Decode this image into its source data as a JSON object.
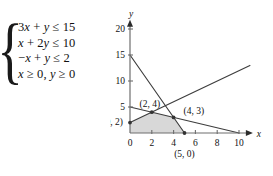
{
  "system": {
    "brace": "{",
    "inequalities": [
      {
        "id": "c1",
        "text": "3x + y ≤ 15"
      },
      {
        "id": "c2",
        "text": "x + 2y ≤ 10"
      },
      {
        "id": "c3",
        "text": "−x + y ≤ 2"
      },
      {
        "id": "c4",
        "text": "x ≥ 0, y ≥ 0"
      }
    ]
  },
  "chart_data": {
    "type": "line",
    "title": "",
    "xlabel": "x",
    "ylabel": "y",
    "xlim": [
      0,
      11
    ],
    "ylim": [
      0,
      21
    ],
    "grid": false,
    "legend": "none",
    "x_ticks": [
      0,
      2,
      4,
      6,
      8,
      10
    ],
    "x_tick_labels": [
      "0",
      "2",
      "4",
      "6",
      "8",
      "10"
    ],
    "y_ticks": [
      0,
      5,
      10,
      15,
      20
    ],
    "y_tick_labels": [
      "0",
      "5",
      "10",
      "15",
      "20"
    ],
    "series": [
      {
        "name": "3x + y = 15",
        "points": [
          [
            0,
            15
          ],
          [
            5,
            0
          ]
        ]
      },
      {
        "name": "x + 2y = 10",
        "points": [
          [
            0,
            5
          ],
          [
            10,
            0
          ]
        ]
      },
      {
        "name": "-x + y = 2",
        "points": [
          [
            0,
            2
          ],
          [
            11,
            13
          ]
        ]
      }
    ],
    "feasible_region": {
      "name": "feasible region",
      "fill": "#d8d8d8",
      "vertices": [
        [
          0,
          0
        ],
        [
          5,
          0
        ],
        [
          4,
          3
        ],
        [
          2,
          4
        ],
        [
          0,
          2
        ]
      ]
    },
    "vertex_markers": [
      {
        "label": "(0, 2)",
        "x": 0,
        "y": 2
      },
      {
        "label": "(2, 4)",
        "x": 2,
        "y": 4
      },
      {
        "label": "(4, 3)",
        "x": 4,
        "y": 3
      },
      {
        "label": "(5, 0)",
        "x": 5,
        "y": 0
      }
    ],
    "colors": {
      "line": "#3d3d3d",
      "axis": "#6e6e6e",
      "shade": "#d8d8d8",
      "text": "#111111"
    }
  }
}
